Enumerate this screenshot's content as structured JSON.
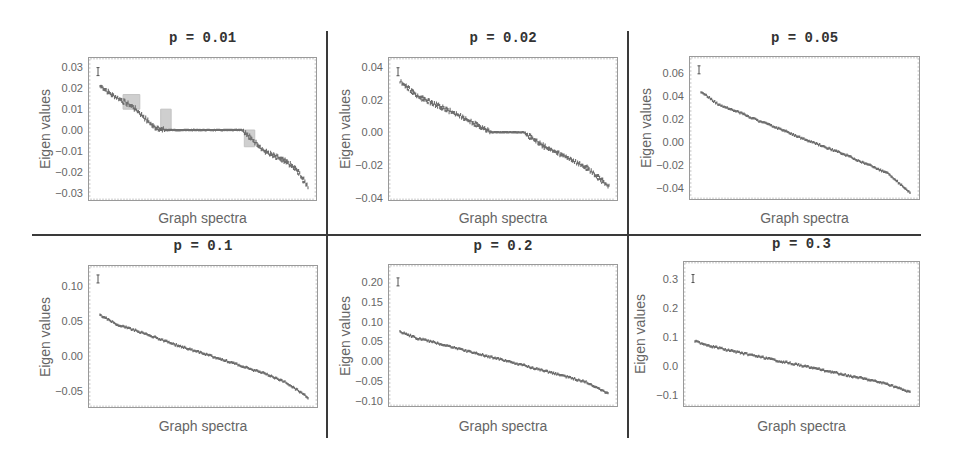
{
  "figure": {
    "layout": "2x3 grid",
    "point_color": "#555555",
    "frame_color": "#9a9a9a",
    "grid_line_color": "#3a3a3a"
  },
  "panels": [
    {
      "title": "p = 0.01",
      "ylabel": "Eigen values",
      "xlabel": "Graph spectra",
      "yticks": [
        "0.03",
        "0.02",
        "0.01",
        "0.00",
        "-0.01",
        "-0.02",
        "-0.03"
      ]
    },
    {
      "title": "p = 0.02",
      "ylabel": "Eigen values",
      "xlabel": "Graph spectra",
      "yticks": [
        "0.04",
        "0.02",
        "0.00",
        "-0.02",
        "-0.04"
      ]
    },
    {
      "title": "p = 0.05",
      "ylabel": "Eigen values",
      "xlabel": "Graph spectra",
      "yticks": [
        "0.06",
        "0.04",
        "0.02",
        "0.00",
        "-0.02",
        "-0.04"
      ]
    },
    {
      "title": "p = 0.1",
      "ylabel": "Eigen values",
      "xlabel": "Graph spectra",
      "yticks": [
        "0.10",
        "0.05",
        "0.00",
        "-0.05"
      ]
    },
    {
      "title": "p = 0.2",
      "ylabel": "Eigen values",
      "xlabel": "Graph spectra",
      "yticks": [
        "0.20",
        "0.15",
        "0.10",
        "0.05",
        "0.00",
        "-0.05",
        "-0.10"
      ]
    },
    {
      "title": "p = 0.3",
      "ylabel": "Eigen values",
      "xlabel": "Graph spectra",
      "yticks": [
        "0.3",
        "0.2",
        "0.1",
        "0.0",
        "-0.1"
      ]
    }
  ],
  "chart_data": [
    {
      "type": "scatter",
      "title": "p = 0.01",
      "xlabel": "Graph spectra",
      "ylabel": "Eigen values",
      "ylim": [
        -0.034,
        0.035
      ],
      "yticks": [
        0.03,
        0.02,
        0.01,
        0.0,
        -0.01,
        -0.02,
        -0.03
      ],
      "grid": false,
      "description": "Sorted eigenvalues (descending) with error bars; largest ~0.028, flat plateau at 0.00 across middle ~45% of spectrum, lowest ~-0.027",
      "x": [
        0,
        0.05,
        0.1,
        0.2,
        0.25,
        0.3,
        0.35,
        0.7,
        0.75,
        0.8,
        0.9,
        0.95,
        1.0
      ],
      "y": [
        0.028,
        0.021,
        0.017,
        0.011,
        0.006,
        0.001,
        0.0,
        0.0,
        -0.005,
        -0.01,
        -0.015,
        -0.019,
        -0.027
      ]
    },
    {
      "type": "scatter",
      "title": "p = 0.02",
      "xlabel": "Graph spectra",
      "ylabel": "Eigen values",
      "ylim": [
        -0.042,
        0.046
      ],
      "yticks": [
        0.04,
        0.02,
        0.0,
        -0.02,
        -0.04
      ],
      "grid": false,
      "description": "Sorted eigenvalues; top outlier ~0.037, smaller plateau at 0.00 near middle, lowest ~-0.033",
      "x": [
        0,
        0.02,
        0.1,
        0.2,
        0.3,
        0.4,
        0.45,
        0.6,
        0.7,
        0.8,
        0.9,
        1.0
      ],
      "y": [
        0.037,
        0.031,
        0.022,
        0.016,
        0.01,
        0.003,
        0.0,
        0.0,
        -0.009,
        -0.015,
        -0.022,
        -0.033
      ]
    },
    {
      "type": "scatter",
      "title": "p = 0.05",
      "xlabel": "Graph spectra",
      "ylabel": "Eigen values",
      "ylim": [
        -0.05,
        0.075
      ],
      "yticks": [
        0.06,
        0.04,
        0.02,
        0.0,
        -0.02,
        -0.04
      ],
      "grid": false,
      "description": "Sorted eigenvalues; outlier ~0.063, bulk from ~0.044 decreasing smoothly to ~-0.044",
      "x": [
        0,
        0.02,
        0.1,
        0.2,
        0.3,
        0.4,
        0.5,
        0.6,
        0.7,
        0.8,
        0.9,
        1.0
      ],
      "y": [
        0.063,
        0.044,
        0.033,
        0.026,
        0.018,
        0.011,
        0.003,
        -0.004,
        -0.011,
        -0.019,
        -0.027,
        -0.044
      ]
    },
    {
      "type": "scatter",
      "title": "p = 0.1",
      "xlabel": "Graph spectra",
      "ylabel": "Eigen values",
      "ylim": [
        -0.075,
        0.13
      ],
      "yticks": [
        0.1,
        0.05,
        0.0,
        -0.05
      ],
      "grid": false,
      "description": "Sorted eigenvalues; outlier ~0.11, bulk from ~0.058 decreasing to ~-0.06",
      "x": [
        0,
        0.02,
        0.1,
        0.2,
        0.3,
        0.4,
        0.5,
        0.6,
        0.7,
        0.8,
        0.9,
        1.0
      ],
      "y": [
        0.11,
        0.058,
        0.045,
        0.035,
        0.024,
        0.013,
        0.004,
        -0.006,
        -0.016,
        -0.026,
        -0.039,
        -0.06
      ]
    },
    {
      "type": "scatter",
      "title": "p = 0.2",
      "xlabel": "Graph spectra",
      "ylabel": "Eigen values",
      "ylim": [
        -0.115,
        0.245
      ],
      "yticks": [
        0.2,
        0.15,
        0.1,
        0.05,
        0.0,
        -0.05,
        -0.1
      ],
      "grid": false,
      "description": "Sorted eigenvalues; outlier ~0.20, bulk from ~0.075 decreasing to ~-0.08",
      "x": [
        0,
        0.02,
        0.1,
        0.2,
        0.3,
        0.4,
        0.5,
        0.6,
        0.7,
        0.8,
        0.9,
        1.0
      ],
      "y": [
        0.2,
        0.075,
        0.058,
        0.045,
        0.031,
        0.017,
        0.004,
        -0.01,
        -0.024,
        -0.038,
        -0.053,
        -0.08
      ]
    },
    {
      "type": "scatter",
      "title": "p = 0.3",
      "xlabel": "Graph spectra",
      "ylabel": "Eigen values",
      "ylim": [
        -0.14,
        0.36
      ],
      "yticks": [
        0.3,
        0.2,
        0.1,
        0.0,
        -0.1
      ],
      "grid": false,
      "description": "Sorted eigenvalues; outlier ~0.30, bulk from ~0.085 decreasing to ~-0.09",
      "x": [
        0,
        0.02,
        0.1,
        0.2,
        0.3,
        0.4,
        0.5,
        0.6,
        0.7,
        0.8,
        0.9,
        1.0
      ],
      "y": [
        0.3,
        0.085,
        0.067,
        0.05,
        0.034,
        0.018,
        0.003,
        -0.013,
        -0.029,
        -0.045,
        -0.062,
        -0.09
      ]
    }
  ]
}
